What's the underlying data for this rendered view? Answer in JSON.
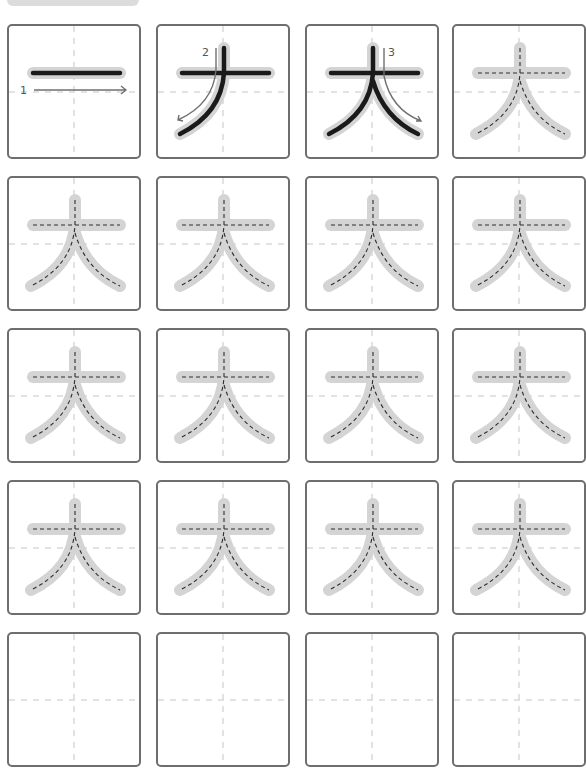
{
  "worksheet": {
    "character": "大",
    "top_bar_color": "#dcdcdc",
    "border_color": "#6e6e6e",
    "columns": 4,
    "rows": 5,
    "stroke_order": [
      {
        "step": 1,
        "label": "1",
        "direction": "left-to-right",
        "stroke": "horizontal"
      },
      {
        "step": 2,
        "label": "2",
        "direction": "top-to-bottom-left",
        "stroke": "left-falling"
      },
      {
        "step": 3,
        "label": "3",
        "direction": "top-to-bottom-right",
        "stroke": "right-falling"
      }
    ],
    "cells": [
      {
        "type": "demo",
        "step": 1
      },
      {
        "type": "demo",
        "step": 2
      },
      {
        "type": "demo",
        "step": 3
      },
      {
        "type": "trace"
      },
      {
        "type": "trace"
      },
      {
        "type": "trace"
      },
      {
        "type": "trace"
      },
      {
        "type": "trace"
      },
      {
        "type": "trace"
      },
      {
        "type": "trace"
      },
      {
        "type": "trace"
      },
      {
        "type": "trace"
      },
      {
        "type": "trace"
      },
      {
        "type": "trace"
      },
      {
        "type": "trace"
      },
      {
        "type": "trace"
      },
      {
        "type": "blank"
      },
      {
        "type": "blank"
      },
      {
        "type": "blank"
      },
      {
        "type": "blank"
      }
    ]
  }
}
